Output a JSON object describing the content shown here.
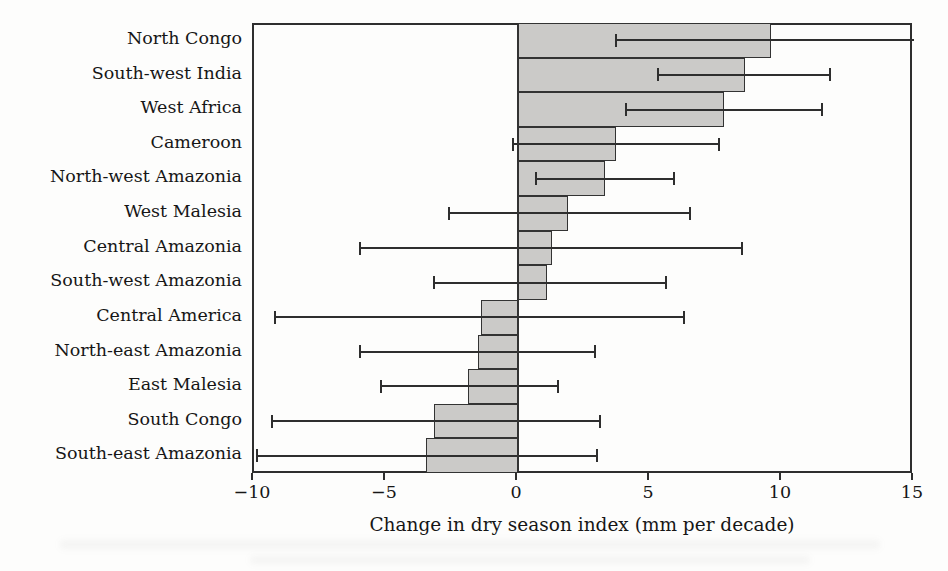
{
  "chart_data": {
    "type": "bar",
    "orientation": "horizontal",
    "title": "",
    "xlabel": "Change in dry season index (mm per decade)",
    "ylabel": "",
    "xlim": [
      -10,
      15
    ],
    "xticks": [
      -10,
      -5,
      0,
      5,
      10,
      15
    ],
    "xtick_labels": [
      "−10",
      "−5",
      "0",
      "5",
      "10",
      "15"
    ],
    "grid": false,
    "legend": "none",
    "categories": [
      "North Congo",
      "South-west India",
      "West Africa",
      "Cameroon",
      "North-west Amazonia",
      "West Malesia",
      "Central Amazonia",
      "South-west Amazonia",
      "Central America",
      "North-east Amazonia",
      "East Malesia",
      "South Congo",
      "South-east Amazonia"
    ],
    "values": [
      9.6,
      8.6,
      7.8,
      3.7,
      3.3,
      1.9,
      1.3,
      1.1,
      -1.4,
      -1.5,
      -1.9,
      -3.2,
      -3.5
    ],
    "error_low": [
      3.7,
      5.3,
      4.1,
      -0.2,
      0.7,
      -2.6,
      -6.0,
      -3.2,
      -9.2,
      -6.0,
      -5.2,
      -9.3,
      -9.9
    ],
    "error_high": [
      15.0,
      11.8,
      11.5,
      7.6,
      5.9,
      6.5,
      8.5,
      5.6,
      6.3,
      2.9,
      1.5,
      3.1,
      3.0
    ],
    "error_high_capped": [
      false,
      true,
      true,
      true,
      true,
      true,
      true,
      true,
      true,
      true,
      true,
      true,
      true
    ],
    "error_low_capped": [
      true,
      true,
      true,
      true,
      true,
      true,
      true,
      true,
      true,
      true,
      true,
      true,
      true
    ],
    "colors": {
      "bar_fill": "#cbcac8",
      "bar_border": "#333333",
      "error_line": "#2e2e2e",
      "axis": "#2e2e2e",
      "text": "#161616",
      "background": "#fdfdfc"
    }
  }
}
